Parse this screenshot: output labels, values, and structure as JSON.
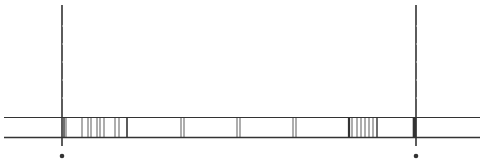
{
  "diagram": {
    "width": 482,
    "height": 165,
    "background": "#ffffff",
    "line_color": "#333333",
    "rails": {
      "top_y": 117.5,
      "bottom_y": 137.5,
      "x_start": 4,
      "x_end": 480,
      "top_stroke": 1,
      "bottom_stroke": 1.6
    },
    "poles": [
      {
        "id": "left-pole",
        "x": 62,
        "y_top": 5,
        "y_bottom": 146,
        "stroke": 1.6,
        "marker_y": 156,
        "marker_r": 2.3
      },
      {
        "id": "right-pole",
        "x": 416,
        "y_top": 5,
        "y_bottom": 146,
        "stroke": 1.6,
        "marker_y": 156,
        "marker_r": 2.3
      }
    ],
    "bars": [
      {
        "x": 64,
        "w": 1.4
      },
      {
        "x": 66,
        "w": 0.8
      },
      {
        "x": 82,
        "w": 0.8
      },
      {
        "x": 88,
        "w": 0.8
      },
      {
        "x": 91,
        "w": 0.8
      },
      {
        "x": 97,
        "w": 0.8
      },
      {
        "x": 100,
        "w": 0.8
      },
      {
        "x": 104,
        "w": 0.8
      },
      {
        "x": 115,
        "w": 0.8
      },
      {
        "x": 119,
        "w": 0.8
      },
      {
        "x": 127,
        "w": 1.6
      },
      {
        "x": 181,
        "w": 0.8
      },
      {
        "x": 184,
        "w": 0.8
      },
      {
        "x": 237,
        "w": 0.8
      },
      {
        "x": 240,
        "w": 0.8
      },
      {
        "x": 293,
        "w": 0.8
      },
      {
        "x": 296,
        "w": 0.8
      },
      {
        "x": 349,
        "w": 2.2
      },
      {
        "x": 352,
        "w": 0.8
      },
      {
        "x": 357,
        "w": 0.8
      },
      {
        "x": 361,
        "w": 0.8
      },
      {
        "x": 365,
        "w": 0.8
      },
      {
        "x": 369,
        "w": 0.8
      },
      {
        "x": 373,
        "w": 0.8
      },
      {
        "x": 377,
        "w": 1.4
      },
      {
        "x": 414.5,
        "w": 3.6
      }
    ]
  }
}
